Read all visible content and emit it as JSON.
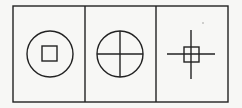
{
  "figure": {
    "stroke_color": "#222222",
    "background_color": "#f7f7f5",
    "outer_frame": {
      "x": 13,
      "y": 6,
      "width": 215,
      "height": 96
    },
    "dividers_x": [
      85,
      156
    ],
    "panels": [
      {
        "index": 1,
        "shapes": [
          {
            "type": "circle",
            "cx": 50,
            "cy": 54,
            "r": 23
          },
          {
            "type": "square",
            "x": 42,
            "y": 46,
            "size": 15
          }
        ]
      },
      {
        "index": 2,
        "shapes": [
          {
            "type": "circle",
            "cx": 120,
            "cy": 54,
            "r": 23
          },
          {
            "type": "line",
            "x1": 97,
            "y1": 54,
            "x2": 143,
            "y2": 54
          },
          {
            "type": "line",
            "x1": 120,
            "y1": 31,
            "x2": 120,
            "y2": 77
          }
        ]
      },
      {
        "index": 3,
        "shapes": [
          {
            "type": "line",
            "x1": 167,
            "y1": 54,
            "x2": 215,
            "y2": 54
          },
          {
            "type": "line",
            "x1": 191,
            "y1": 30,
            "x2": 191,
            "y2": 79
          },
          {
            "type": "square",
            "x": 184,
            "y": 47,
            "size": 15
          }
        ]
      }
    ]
  }
}
